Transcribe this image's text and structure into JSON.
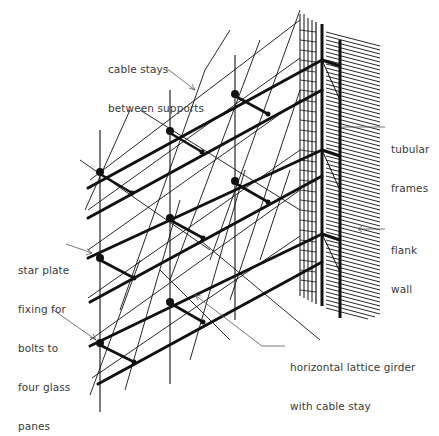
{
  "diagram": {
    "type": "axonometric structural drawing",
    "colors": {
      "ink": "#111111",
      "leader": "#555555",
      "text": "#3a3a3a",
      "background": "#ffffff"
    }
  },
  "labels": {
    "cable_stays": {
      "line1": "cable stays",
      "line2": "between supports"
    },
    "tubular_frames": {
      "line1": "tubular",
      "line2": "frames"
    },
    "flank_wall": {
      "line1": "flank",
      "line2": "wall"
    },
    "star_plate": {
      "line1": "star plate",
      "line2": "fixing for",
      "line3": "bolts to",
      "line4": "four glass",
      "line5": "panes"
    },
    "lattice_girder": {
      "line1": "horizontal lattice girder",
      "line2": "with cable stay"
    }
  }
}
